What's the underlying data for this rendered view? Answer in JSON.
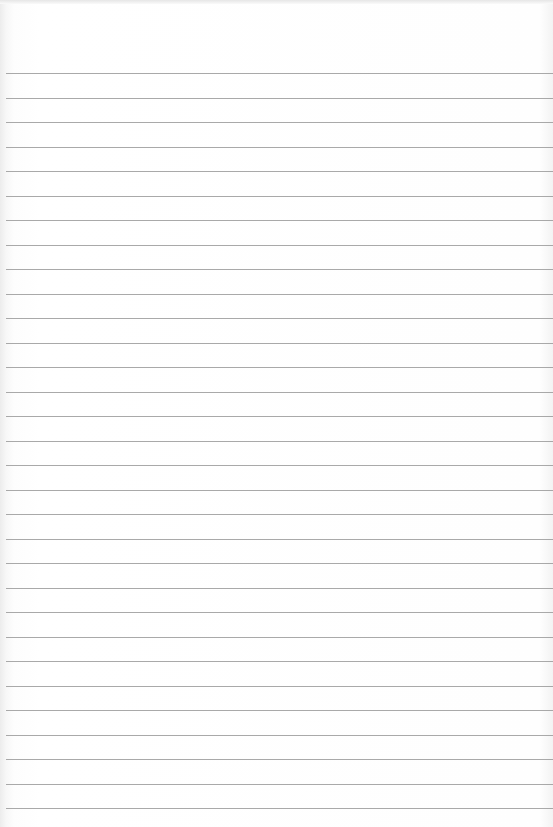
{
  "page": {
    "type": "lined-paper",
    "background_color": "#ffffff",
    "rule_color": "#9a9a9a",
    "first_rule_y": 73,
    "rule_spacing": 24.5,
    "rule_count": 31
  }
}
